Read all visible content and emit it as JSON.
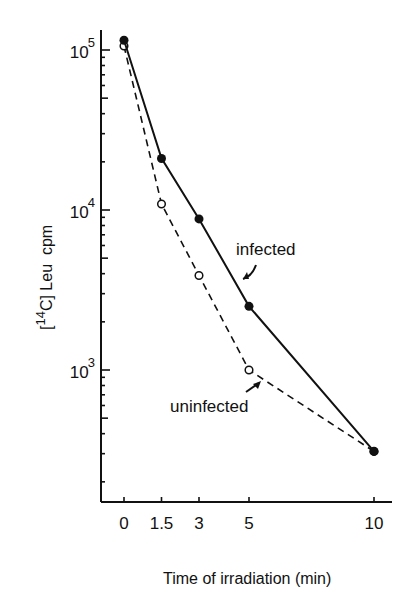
{
  "chart_data": {
    "type": "line",
    "title": "",
    "xlabel": "Time of irradiation (min)",
    "ylabel": "[14C] Leu cpm",
    "ylabel_parts": {
      "bracket_open": "[",
      "superscript": "14",
      "element": "C]",
      "rest": " Leu  cpm"
    },
    "yscale": "log",
    "ylim": [
      150,
      130000
    ],
    "xlim": [
      -1,
      11.2
    ],
    "grid": false,
    "x_ticks": [
      0,
      1.5,
      3,
      5,
      10
    ],
    "x_tick_labels": [
      "0",
      "1.5",
      "3",
      "5",
      "10"
    ],
    "y_ticks": [
      1000,
      10000,
      100000
    ],
    "y_tick_labels": [
      {
        "base": "10",
        "exp": "3"
      },
      {
        "base": "10",
        "exp": "4"
      },
      {
        "base": "10",
        "exp": "5"
      }
    ],
    "series": [
      {
        "name": "infected",
        "style": "solid",
        "marker": "filled-circle",
        "x": [
          0,
          1.5,
          3,
          5,
          10
        ],
        "values": [
          115000,
          21000,
          8800,
          2500,
          310
        ]
      },
      {
        "name": "uninfected",
        "style": "dashed",
        "marker": "open-circle",
        "x": [
          0,
          1.5,
          3,
          5,
          10
        ],
        "values": [
          106000,
          10900,
          3900,
          1000,
          310
        ]
      }
    ],
    "annotations": [
      {
        "text": "infected",
        "points_to": "infected line between 3 and 5 min"
      },
      {
        "text": "uninfected",
        "points_to": "uninfected line between 5 and 10 min"
      }
    ],
    "legend": "none (inline labels with arrows)"
  }
}
